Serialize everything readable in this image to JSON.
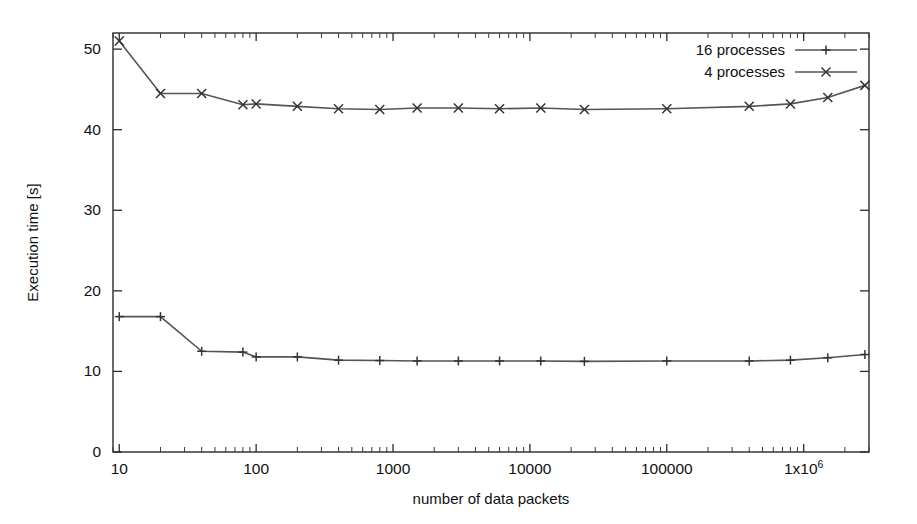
{
  "chart_data": {
    "type": "line",
    "title": "",
    "xlabel": "number of data packets",
    "ylabel": "Execution time [s]",
    "xscale": "log",
    "yscale": "linear",
    "xlim": [
      9,
      3000000
    ],
    "ylim": [
      0,
      52
    ],
    "grid": false,
    "legend_position": "top-right",
    "xticks": [
      10,
      100,
      1000,
      10000,
      100000,
      1000000
    ],
    "xtick_labels": [
      "10",
      "100",
      "1000",
      "10000",
      "100000",
      "1x10^6"
    ],
    "yticks": [
      0,
      10,
      20,
      30,
      40,
      50
    ],
    "ytick_labels": [
      "0",
      "10",
      "20",
      "30",
      "40",
      "50"
    ],
    "series": [
      {
        "name": "16 processes",
        "marker": "plus",
        "color": "#555555",
        "x": [
          10,
          20,
          40,
          80,
          100,
          200,
          400,
          800,
          1500,
          3000,
          6000,
          12000,
          25000,
          100000,
          400000,
          800000,
          1500000,
          2800000
        ],
        "y": [
          16.8,
          16.8,
          12.5,
          12.4,
          11.8,
          11.8,
          11.4,
          11.35,
          11.3,
          11.3,
          11.3,
          11.3,
          11.25,
          11.3,
          11.3,
          11.4,
          11.7,
          12.1
        ]
      },
      {
        "name": "4 processes",
        "marker": "cross",
        "color": "#555555",
        "x": [
          10,
          20,
          40,
          80,
          100,
          200,
          400,
          800,
          1500,
          3000,
          6000,
          12000,
          25000,
          100000,
          400000,
          800000,
          1500000,
          2800000
        ],
        "y": [
          51.0,
          44.5,
          44.5,
          43.1,
          43.2,
          42.9,
          42.6,
          42.5,
          42.7,
          42.7,
          42.6,
          42.7,
          42.5,
          42.6,
          42.9,
          43.2,
          44.0,
          45.5
        ]
      }
    ]
  },
  "legend": {
    "entries": [
      {
        "label": "16 processes",
        "marker": "plus"
      },
      {
        "label": "4 processes",
        "marker": "cross"
      }
    ]
  },
  "axes": {
    "y_title": "Execution time [s]",
    "x_title": "number of data packets",
    "x_last_tick_mantissa": "1x10",
    "x_last_tick_exponent": "6"
  }
}
